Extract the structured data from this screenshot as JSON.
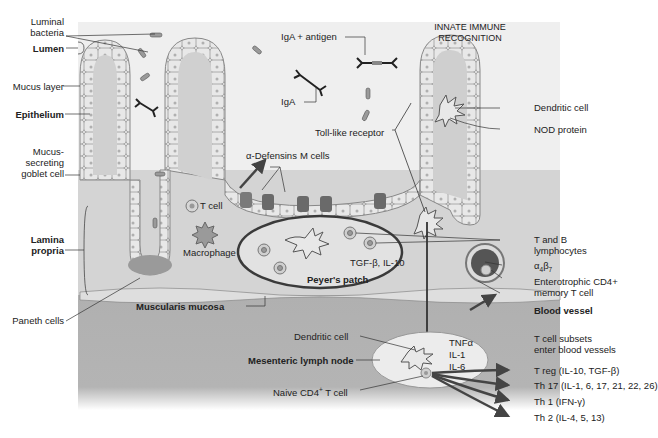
{
  "colors": {
    "lumen": "#efefef",
    "lamina_propria": "#d3d3d3",
    "submucosa": "#b4b4b4",
    "epithelium_cell": "#e6e6e6",
    "goblet_cell": "#8c8c8c",
    "peyers_patch": "#e4e4e4",
    "lymph_node": "#ececec",
    "line": "#333333",
    "arrow": "#555555"
  },
  "left_labels": {
    "luminal_bacteria": "Luminal\nbacteria",
    "lumen": "Lumen",
    "mucus_layer": "Mucus layer",
    "epithelium": "Epithelium",
    "goblet_cell": "Mucus-\nsecreting\ngoblet cell",
    "lamina_propria": "Lamina\npropria",
    "paneth_cells": "Paneth cells"
  },
  "top_labels": {
    "iga_antigen": "IgA + antigen",
    "iga": "IgA",
    "innate_recognition": "INNATE IMMUNE\nRECOGNITION"
  },
  "center_labels": {
    "alpha_defensins": "α-Defensins",
    "m_cells": "M cells",
    "toll_like_receptor": "Toll-like receptor",
    "t_cell": "T cell",
    "macrophage": "Macrophage",
    "tgf_il10": "TGF-β, IL-10",
    "peyers_patch": "Peyer's patch",
    "muscularis_mucosa": "Muscularis mucosa",
    "dendritic_cell_node": "Dendritic cell",
    "mesenteric_lymph_node": "Mesenteric lymph node",
    "naive_cd4": "Naive CD4",
    "naive_cd4_sup": "+",
    "naive_cd4_suffix": " T cell",
    "cytokines": [
      "TNFα",
      "IL-1",
      "IL-6"
    ]
  },
  "right_labels": {
    "dendritic_cell": "Dendritic cell",
    "nod_protein": "NOD protein",
    "t_b_lymphocytes": "T and B\nlymphocytes",
    "alpha4beta7_a": "α",
    "alpha4beta7_sub1": "4",
    "alpha4beta7_b": "β",
    "alpha4beta7_sub2": "7",
    "enterotrophic": "Enterotrophic CD4+\nmemory T cell",
    "blood_vessel": "Blood vessel",
    "t_subsets": "T cell subsets\nenter blood vessels"
  },
  "t_cell_subsets": [
    "T reg (IL-10, TGF-β)",
    "Th 17 (IL-1, 6, 17, 21, 22, 26)",
    "Th 1 (IFN-γ)",
    "Th 2 (IL-4, 5, 13)"
  ]
}
